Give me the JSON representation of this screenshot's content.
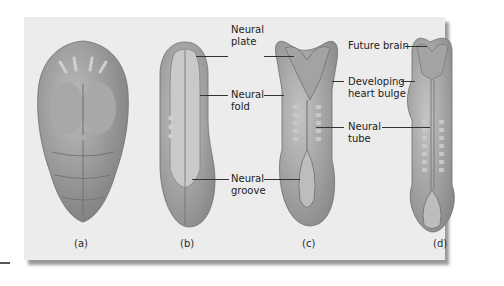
{
  "figure": {
    "panels": [
      {
        "id": "a",
        "caption": "(a)"
      },
      {
        "id": "b",
        "caption": "(b)",
        "labels": [
          "Neural plate",
          "Neural fold",
          "Neural groove"
        ]
      },
      {
        "id": "c",
        "caption": "(c)"
      },
      {
        "id": "d",
        "caption": "(d)",
        "labels": [
          "Future brain",
          "Developing heart bulge",
          "Neural tube"
        ]
      }
    ],
    "labels": {
      "neural_plate": "Neural\nplate",
      "neural_fold": "Neural\nfold",
      "neural_groove": "Neural\ngroove",
      "future_brain": "Future brain",
      "heart_bulge": "Developing\nheart bulge",
      "neural_tube": "Neural\ntube"
    },
    "colors": {
      "background": "#ececec",
      "embryo": "#8f8f8f",
      "embryo_light": "#b5b5b5",
      "shadow": "#9a9a9a"
    }
  }
}
